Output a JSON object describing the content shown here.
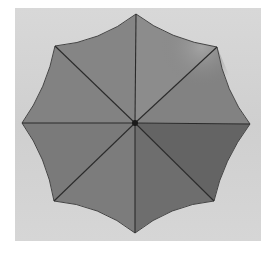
{
  "scene": {
    "subject": "umbrella top view",
    "panels": 8,
    "colors": {
      "page_background": "#ffffff",
      "panel_background": "#d3d3d3",
      "canopy_light": "#8a8a8a",
      "canopy_highlight": "#a0a0a0",
      "canopy_dark": "#5e5e5e",
      "rib_line": "#2a2a2a",
      "center_cap": "#1a1a1a"
    }
  }
}
